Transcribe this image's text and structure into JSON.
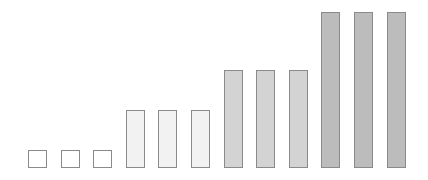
{
  "chart_data": {
    "type": "bar",
    "title": "",
    "xlabel": "",
    "ylabel": "",
    "grid": false,
    "legend": null,
    "categories": [
      "1",
      "2",
      "3",
      "4",
      "5",
      "6",
      "7",
      "8",
      "9",
      "10",
      "11",
      "12"
    ],
    "values": [
      1,
      1,
      1,
      3.2,
      3.2,
      3.2,
      5.4,
      5.4,
      5.4,
      8.6,
      8.6,
      8.6
    ],
    "groups": [
      {
        "name": "group-1",
        "bars": [
          0,
          1,
          2
        ],
        "fill": "#ffffff"
      },
      {
        "name": "group-2",
        "bars": [
          3,
          4,
          5
        ],
        "fill": "#f2f2f2"
      },
      {
        "name": "group-3",
        "bars": [
          6,
          7,
          8
        ],
        "fill": "#d3d3d3"
      },
      {
        "name": "group-4",
        "bars": [
          9,
          10,
          11
        ],
        "fill": "#bcbcbc"
      }
    ],
    "ylim": [
      0,
      9
    ],
    "border_color": "#8a8a8a",
    "layout": {
      "first_bar_left": 28,
      "bar_width": 19,
      "bar_step": 32.6,
      "baseline_y": 168,
      "px_per_unit": 18.1
    }
  }
}
